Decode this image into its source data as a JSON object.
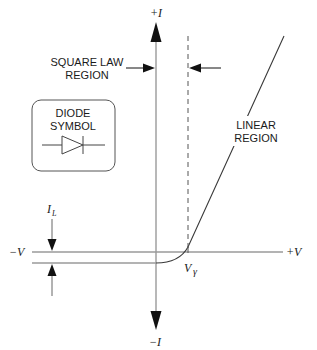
{
  "diagram": {
    "axes": {
      "y_positive": "+I",
      "y_negative": "−I",
      "x_positive": "+V",
      "x_negative": "−V"
    },
    "labels": {
      "square_law_line1": "SQUARE LAW",
      "square_law_line2": "REGION",
      "linear_line1": "LINEAR",
      "linear_line2": "REGION",
      "diode_line1": "DIODE",
      "diode_line2": "SYMBOL",
      "leakage_current": "I",
      "leakage_current_sub": "L",
      "threshold_voltage": "V",
      "threshold_voltage_sub": "γ"
    },
    "colors": {
      "axis": "#9a9a9a",
      "curve": "#3a3a3a",
      "arrow": "#111111",
      "text": "#1a1a1a"
    }
  }
}
